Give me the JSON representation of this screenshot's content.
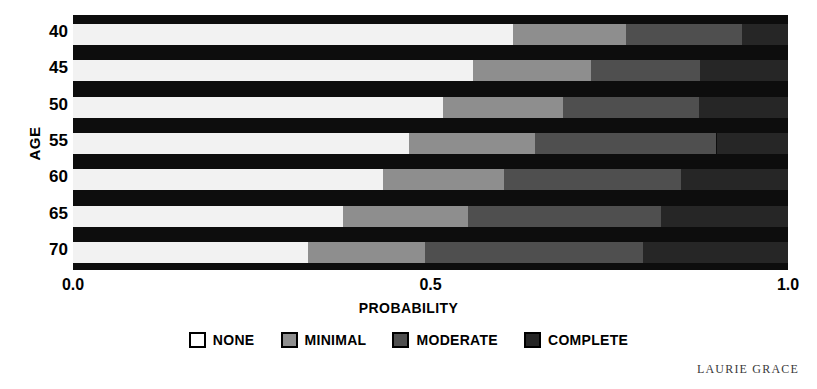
{
  "chart_data": {
    "type": "bar",
    "orientation": "horizontal",
    "stacked": true,
    "title": "",
    "xlabel": "PROBABILITY",
    "ylabel": "AGE",
    "xlim": [
      0.0,
      1.0
    ],
    "xticks": [
      "0.0",
      "0.5",
      "1.0"
    ],
    "xtick_values": [
      0.0,
      0.5,
      1.0
    ],
    "categories": [
      "40",
      "45",
      "50",
      "55",
      "60",
      "65",
      "70"
    ],
    "grid": false,
    "legend_position": "bottom",
    "series": [
      {
        "name": "NONE",
        "color": "#f2f2f2",
        "values": [
          0.615,
          0.56,
          0.518,
          0.47,
          0.434,
          0.378,
          0.329
        ]
      },
      {
        "name": "MINIMAL",
        "color": "#8e8e8e",
        "values": [
          0.158,
          0.165,
          0.168,
          0.176,
          0.169,
          0.175,
          0.163
        ]
      },
      {
        "name": "MODERATE",
        "color": "#4f4f4f",
        "values": [
          0.162,
          0.152,
          0.189,
          0.254,
          0.247,
          0.27,
          0.305
        ]
      },
      {
        "name": "COMPLETE",
        "color": "#262626",
        "values": [
          0.065,
          0.123,
          0.125,
          0.1,
          0.15,
          0.177,
          0.203
        ]
      }
    ],
    "cumulative_boundaries": {
      "40": [
        0.615,
        0.773,
        0.935,
        1.0
      ],
      "45": [
        0.56,
        0.725,
        0.877,
        1.0
      ],
      "50": [
        0.518,
        0.686,
        0.875,
        1.0
      ],
      "55": [
        0.47,
        0.646,
        0.9,
        1.0
      ],
      "60": [
        0.434,
        0.603,
        0.85,
        1.0
      ],
      "65": [
        0.378,
        0.553,
        0.823,
        1.0
      ],
      "70": [
        0.329,
        0.492,
        0.797,
        1.0
      ]
    }
  },
  "axes": {
    "y_title": "AGE",
    "x_title": "PROBABILITY",
    "y_ticks": [
      "40",
      "45",
      "50",
      "55",
      "60",
      "65",
      "70"
    ],
    "x_ticks": [
      "0.0",
      "0.5",
      "1.0"
    ]
  },
  "legend": {
    "items": [
      {
        "label": "NONE",
        "color": "#ffffff"
      },
      {
        "label": "MINIMAL",
        "color": "#8e8e8e"
      },
      {
        "label": "MODERATE",
        "color": "#4f4f4f"
      },
      {
        "label": "COMPLETE",
        "color": "#262626"
      }
    ]
  },
  "credit": "LAURIE GRACE",
  "colors": {
    "plot_background": "#0d0d0d",
    "none": "#f2f2f2",
    "minimal": "#8e8e8e",
    "moderate": "#4f4f4f",
    "complete": "#262626"
  }
}
